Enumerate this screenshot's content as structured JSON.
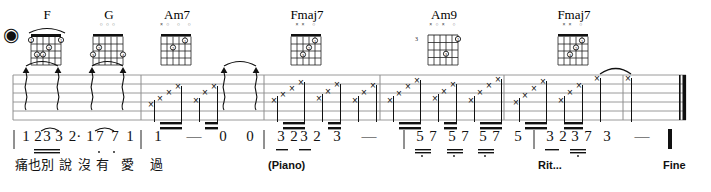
{
  "document": {
    "type": "guitar-lead-sheet",
    "width": 711,
    "height": 192,
    "notation": "numbered-notation-with-guitar-tab",
    "end_marking": "Fine"
  },
  "chords": [
    {
      "name": "F",
      "x": 18,
      "open_marks": "",
      "barre": true,
      "start_fret": ""
    },
    {
      "name": "G",
      "x": 80,
      "open_marks": "○○○",
      "barre": false,
      "start_fret": ""
    },
    {
      "name": "Am7",
      "x": 148,
      "open_marks": "×○ ○ ○",
      "barre": false,
      "start_fret": ""
    },
    {
      "name": "Fmaj7",
      "x": 278,
      "open_marks": "××      ○",
      "barre": false,
      "start_fret": ""
    },
    {
      "name": "Am9",
      "x": 415,
      "open_marks": "×○×  ○",
      "barre": false,
      "start_fret": "3"
    },
    {
      "name": "Fmaj7",
      "x": 545,
      "open_marks": "××      ○",
      "barre": false,
      "start_fret": ""
    }
  ],
  "measures": [
    {
      "index": 1,
      "numbers": [
        "1",
        "2",
        "3",
        "3",
        "2·",
        "1",
        "7",
        "7",
        "1"
      ],
      "lyrics": [
        "痛",
        "也",
        "別",
        "說",
        "沒",
        "有",
        "",
        "愛",
        "過"
      ]
    },
    {
      "index": 2,
      "numbers": [
        "1",
        "—",
        "0",
        "0"
      ],
      "lyrics": []
    },
    {
      "index": 3,
      "numbers": [
        "3",
        "2",
        "3",
        "2",
        "3",
        "—"
      ],
      "annotation": "(Piano)"
    },
    {
      "index": 4,
      "numbers": [
        "5",
        "7",
        "5",
        "7",
        "5",
        "7",
        "5"
      ],
      "annotation": ""
    },
    {
      "index": 5,
      "numbers": [
        "3",
        "2",
        "3",
        "7",
        "3",
        "—"
      ],
      "annotation": "Rit..."
    }
  ],
  "annotations": {
    "piano": "(Piano)",
    "rit": "Rit...",
    "fine": "Fine"
  },
  "tab": {
    "string_count": 6,
    "strum_symbol": "×",
    "arpeggio_symbol": "arrow-up-wavy"
  },
  "colors": {
    "ink": "#111111",
    "staff": "#9a9a9a",
    "paper": "#ffffff"
  }
}
